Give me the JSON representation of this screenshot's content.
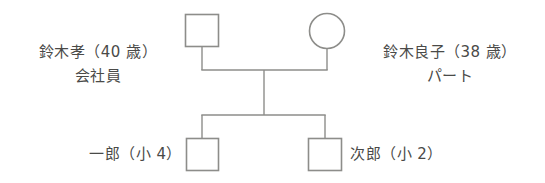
{
  "diagram": {
    "type": "genogram",
    "title": "",
    "background_color": "#ffffff",
    "stroke_color": "#8d8d8a",
    "text_color": "#4a4a48",
    "father": {
      "shape": "square",
      "name_line": "鈴木孝（40 歳）",
      "occupation_line": "会社員"
    },
    "mother": {
      "shape": "circle",
      "name_line": "鈴木良子（38 歳）",
      "occupation_line": "パート"
    },
    "child_first": {
      "shape": "square",
      "label": "一郎（小 4）"
    },
    "child_second": {
      "shape": "square",
      "label": "次郎（小 2）"
    }
  }
}
